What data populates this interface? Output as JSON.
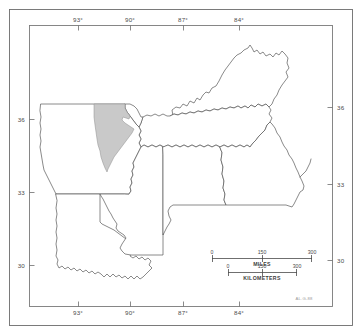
{
  "figure": {
    "type": "reference-map",
    "projection_note": "latitude-longitude graticule ticks"
  },
  "graticule": {
    "longitude_labels_top": [
      "93°",
      "90°",
      "87°",
      "84°"
    ],
    "longitude_labels_bottom": [
      "93°",
      "90°",
      "87°",
      "84°"
    ],
    "latitude_labels_left": [
      "36",
      "33",
      "30"
    ],
    "latitude_labels_right": [
      "36",
      "33",
      "30"
    ]
  },
  "scalebars": [
    {
      "unit_label": "MILES",
      "ticks": [
        "0",
        "150",
        "300"
      ]
    },
    {
      "unit_label": "KILOMETERS",
      "ticks": [
        "0",
        "150",
        "300"
      ]
    }
  ],
  "credit": {
    "text": "AL.G-88"
  },
  "legend": {
    "shaded_area_name": "study-area-shaded",
    "shaded_color": "#c9c9c9"
  },
  "colors": {
    "background": "#ffffff",
    "frame": "#6d6d6d",
    "state_outline": "#4a4a4a",
    "shade_fill": "#c9c9c9",
    "label": "#4a4a4a"
  },
  "states": [
    {
      "name": "arkansas"
    },
    {
      "name": "louisiana"
    },
    {
      "name": "mississippi"
    },
    {
      "name": "tennessee"
    },
    {
      "name": "kentucky"
    },
    {
      "name": "alabama"
    },
    {
      "name": "georgia"
    },
    {
      "name": "missouri-bootheel"
    }
  ]
}
